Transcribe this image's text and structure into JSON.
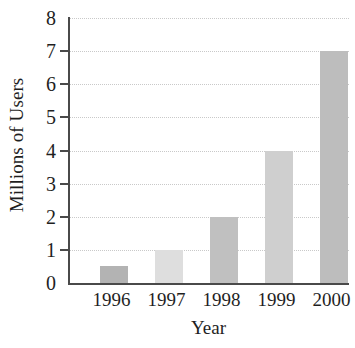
{
  "chart_data": {
    "type": "bar",
    "title": "",
    "subtitle": "",
    "xlabel": "Year",
    "ylabel": "Millions of Users",
    "categories": [
      "1996",
      "1997",
      "1998",
      "1999",
      "2000"
    ],
    "values": [
      0.5,
      1,
      2,
      4,
      7
    ],
    "series": [
      {
        "name": "Millions of Users",
        "values": [
          0.5,
          1,
          2,
          4,
          7
        ]
      }
    ],
    "ylim": [
      0,
      8
    ],
    "yticks": [
      "0",
      "1",
      "2",
      "3",
      "4",
      "5",
      "6",
      "7",
      "8"
    ],
    "ytick_values": [
      0,
      1,
      2,
      3,
      4,
      5,
      6,
      7,
      8
    ],
    "grid": "horizontal-dotted",
    "legend": "none",
    "bar_colors": [
      "#b3b3b3",
      "#dedede",
      "#c0c0c0",
      "#cfcfcf",
      "#bdbdbd"
    ],
    "axis_color": "#4a4a4a",
    "gridline_color": "#c9c9c9",
    "background_color": "#ffffff",
    "text_color": "#1f1f1f"
  }
}
